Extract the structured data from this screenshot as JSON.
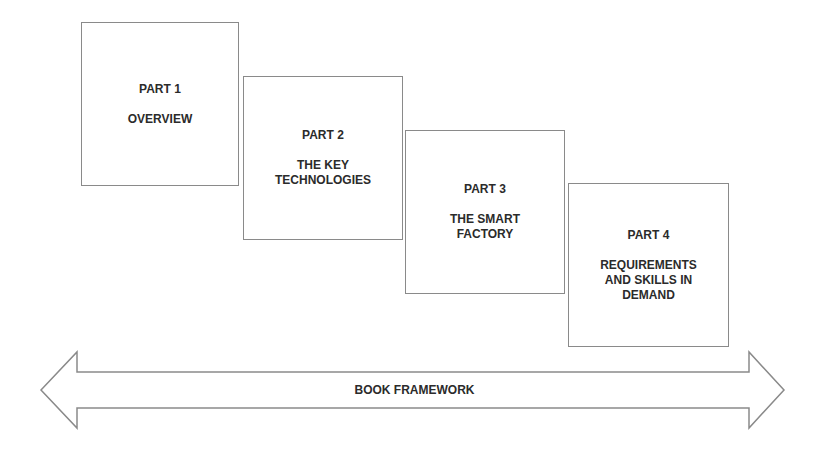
{
  "parts": [
    {
      "title": "PART 1",
      "subtitle": "OVERVIEW"
    },
    {
      "title": "PART 2",
      "subtitle": "THE KEY\nTECHNOLOGIES"
    },
    {
      "title": "PART 3",
      "subtitle": "THE SMART\nFACTORY"
    },
    {
      "title": "PART 4",
      "subtitle": "REQUIREMENTS\nAND SKILLS IN\nDEMAND"
    }
  ],
  "arrow": {
    "label": "BOOK FRAMEWORK"
  },
  "colors": {
    "stroke": "#8a8a8a",
    "text": "#2b2b2b",
    "background": "#ffffff"
  }
}
